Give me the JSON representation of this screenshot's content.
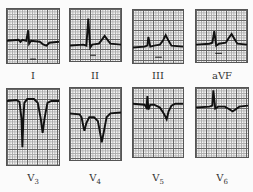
{
  "figure": {
    "leads": [
      {
        "id": "I",
        "label": "I",
        "sub": ""
      },
      {
        "id": "II",
        "label": "II",
        "sub": ""
      },
      {
        "id": "III",
        "label": "III",
        "sub": ""
      },
      {
        "id": "aVF",
        "label": "aVF",
        "sub": ""
      },
      {
        "id": "V3",
        "label": "V",
        "sub": "3"
      },
      {
        "id": "V4",
        "label": "V",
        "sub": "4"
      },
      {
        "id": "V5",
        "label": "V",
        "sub": "5"
      },
      {
        "id": "V6",
        "label": "V",
        "sub": "6"
      }
    ],
    "trace_color": "#111111",
    "grid_color": "#666666"
  }
}
